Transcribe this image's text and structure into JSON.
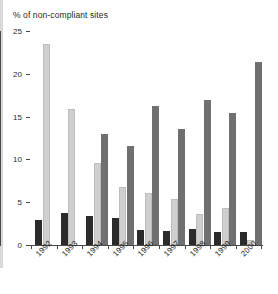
{
  "chart_data": {
    "type": "bar",
    "title": "% of non-compliant sites",
    "xlabel": "",
    "ylabel": "",
    "ylim": [
      0,
      25
    ],
    "yticks": [
      0,
      5,
      10,
      15,
      20,
      25
    ],
    "ytick_labels": [
      "0",
      "5",
      "10",
      "15",
      "20",
      "25"
    ],
    "grid": false,
    "legend": "none",
    "categories": [
      "1992",
      "1993",
      "1994",
      "1995",
      "1996",
      "1997",
      "1998",
      "1999",
      "2000"
    ],
    "series": [
      {
        "name": "series-a",
        "color": "#2b2b2b",
        "values": [
          2.9,
          3.7,
          3.4,
          3.2,
          1.8,
          1.6,
          1.9,
          1.5,
          1.5
        ]
      },
      {
        "name": "series-b",
        "color": "#cfcfcf",
        "values": [
          23.5,
          15.9,
          9.6,
          6.8,
          6.1,
          5.4,
          3.6,
          4.3,
          0.6
        ]
      },
      {
        "name": "series-c",
        "color": "#707070",
        "values": [
          null,
          null,
          13.0,
          11.6,
          16.2,
          13.5,
          16.9,
          15.4,
          21.4
        ]
      }
    ]
  },
  "colors": {
    "axis": "#4a4a4a",
    "text": "#1f1f1f",
    "background": "#ffffff",
    "series_a": "#2b2b2b",
    "series_b": "#cfcfcf",
    "series_c": "#707070"
  }
}
